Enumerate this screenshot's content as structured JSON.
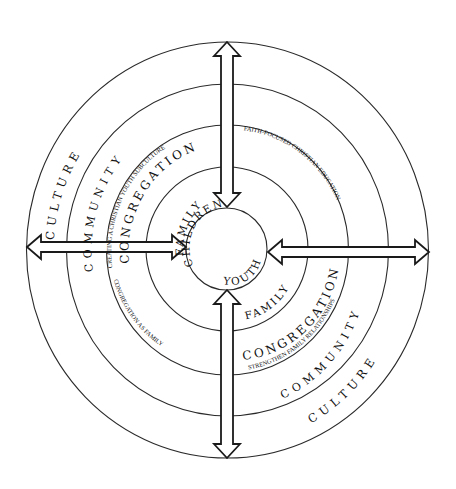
{
  "diagram": {
    "type": "concentric-circles",
    "center_rings": {
      "core": {
        "top_label": "CHILDREN",
        "bottom_label": "YOUTH"
      },
      "family": {
        "upper_left_label": "FAMILY",
        "lower_right_label": "FAMILY"
      },
      "congregation": {
        "upper_left_label": "CONGREGATION",
        "upper_left_sub": "CREATING A CHRISTIAN YOUTH SUBCULTURE",
        "upper_right_sub": "FAITH-FOCUSED CHRISTIAN EDUCATION",
        "lower_left_sub": "CONGREGATION AS FAMILY",
        "lower_right_label": "CONGREGATION",
        "lower_right_sub": "STRENGTHEN FAMILY RELATIONSHIPS"
      },
      "community": {
        "upper_left_label": "COMMUNITY",
        "lower_right_label": "COMMUNITY"
      },
      "culture": {
        "upper_left_label": "CULTURE",
        "lower_right_label": "CULTURE"
      }
    },
    "arrows": [
      {
        "name": "top",
        "direction": "vertical",
        "style": "double-headed"
      },
      {
        "name": "left",
        "direction": "horizontal",
        "style": "double-headed"
      },
      {
        "name": "right",
        "direction": "horizontal",
        "style": "double-headed"
      },
      {
        "name": "bottom",
        "direction": "vertical",
        "style": "double-headed"
      }
    ],
    "colors": {
      "line": "#1a1a1a",
      "background": "#ffffff"
    }
  }
}
